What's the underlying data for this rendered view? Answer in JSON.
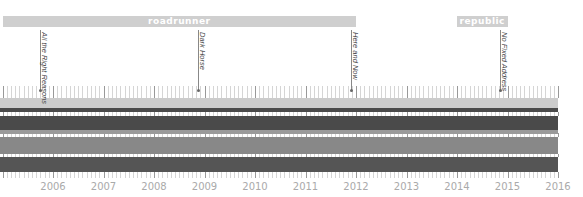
{
  "chart_data": {
    "type": "timeline",
    "title": "",
    "x_axis": {
      "start_year": 2005,
      "end_year": 2016,
      "tick_labels": [
        "2006",
        "2007",
        "2008",
        "2009",
        "2010",
        "2011",
        "2012",
        "2013",
        "2014",
        "2015",
        "2016"
      ],
      "minor_ticks_per_year": 12
    },
    "eras": [
      {
        "label": "roadrunner",
        "start": 2005.0,
        "end": 2012.0
      },
      {
        "label": "republic",
        "start": 2014.0,
        "end": 2015.0
      }
    ],
    "albums": [
      {
        "title": "All the Right Reasons",
        "date": 2005.75
      },
      {
        "title": "Dark Horse",
        "date": 2008.88
      },
      {
        "title": "Here and Now",
        "date": 2011.9
      },
      {
        "title": "No Fixed Address",
        "date": 2014.85
      }
    ],
    "bands": [
      {
        "name": "band-1",
        "start": 2005.0,
        "end": 2016.0,
        "top": 98,
        "height": 10,
        "color": "#cccccc"
      },
      {
        "name": "band-2",
        "start": 2005.0,
        "end": 2016.0,
        "top": 108,
        "height": 4,
        "color": "#4a4a4a"
      },
      {
        "name": "band-3",
        "start": 2005.0,
        "end": 2016.0,
        "top": 116,
        "height": 14,
        "color": "#4a4a4a"
      },
      {
        "name": "band-4",
        "start": 2005.0,
        "end": 2016.0,
        "top": 130,
        "height": 4,
        "color": "#9a9a9a"
      },
      {
        "name": "band-5",
        "start": 2005.0,
        "end": 2016.0,
        "top": 137,
        "height": 17,
        "color": "#888888"
      },
      {
        "name": "band-6",
        "start": 2005.0,
        "end": 2016.0,
        "top": 157,
        "height": 15,
        "color": "#555555"
      }
    ]
  },
  "layout": {
    "px_per_year": 50.5,
    "origin_x": 2.5,
    "origin_year": 2005
  }
}
